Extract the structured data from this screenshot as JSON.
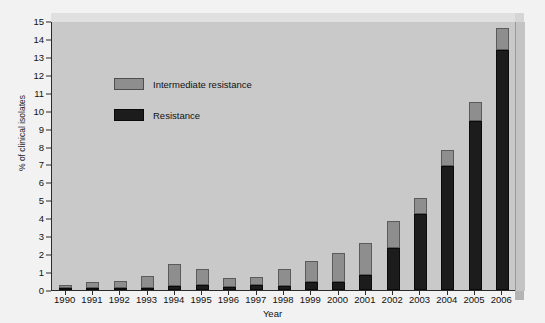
{
  "figure": {
    "top_sliver_text": "",
    "background_color": "#f2f2f2",
    "plot_background_color": "#c9c9c9"
  },
  "legend": {
    "position": "inside-top-left",
    "entries": [
      {
        "label": "Intermediate resistance",
        "color": "#8e8e8e",
        "key": "intermediate"
      },
      {
        "label": "Resistance",
        "color": "#1c1c1c",
        "key": "resistance"
      }
    ]
  },
  "axes": {
    "y_title": "% of clinical isolates",
    "x_title": "Year",
    "y_ticks": [
      "0",
      "1",
      "2",
      "3",
      "4",
      "5",
      "6",
      "7",
      "8",
      "9",
      "10",
      "11",
      "12",
      "13",
      "14",
      "15"
    ]
  },
  "chart_data": {
    "type": "bar",
    "title": "",
    "subtitle": "",
    "stacked": true,
    "xlabel": "Year",
    "ylabel": "% of clinical isolates",
    "ylim": [
      0,
      15
    ],
    "ytick_step": 1,
    "grid": false,
    "legend_position": "inside-top-left",
    "categories": [
      "1990",
      "1991",
      "1992",
      "1993",
      "1994",
      "1995",
      "1996",
      "1997",
      "1998",
      "1999",
      "2000",
      "2001",
      "2002",
      "2003",
      "2004",
      "2005",
      "2006"
    ],
    "series": [
      {
        "name": "Resistance",
        "color": "#1c1c1c",
        "values": [
          0.05,
          0.1,
          0.1,
          0.12,
          0.2,
          0.27,
          0.15,
          0.3,
          0.22,
          0.45,
          0.45,
          0.85,
          2.35,
          4.25,
          6.9,
          9.4,
          13.4
        ]
      },
      {
        "name": "Intermediate resistance",
        "color": "#8e8e8e",
        "values": [
          0.15,
          0.35,
          0.4,
          0.68,
          1.25,
          0.93,
          0.5,
          0.4,
          0.93,
          1.15,
          1.6,
          1.8,
          1.5,
          0.9,
          0.9,
          1.1,
          1.2
        ]
      }
    ],
    "totals": [
      0.2,
      0.45,
      0.5,
      0.8,
      1.45,
      1.2,
      0.65,
      0.7,
      1.15,
      1.6,
      2.05,
      2.65,
      3.85,
      5.15,
      7.8,
      10.5,
      14.6
    ]
  }
}
